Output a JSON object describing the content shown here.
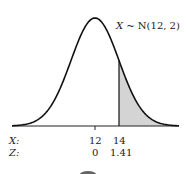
{
  "chart_data": {
    "type": "area",
    "title": "X ~ N(12, 2)",
    "distribution": {
      "name": "Normal",
      "mean": 12,
      "sd": 2
    },
    "shaded_region": {
      "from_x": 14,
      "to": "infinity",
      "from_z": 1.41,
      "color": "#d3d3d3"
    },
    "axis_rows": [
      {
        "label": "X:",
        "ticks": [
          "12",
          "14"
        ]
      },
      {
        "label": "Z:",
        "ticks": [
          "0",
          "1.41"
        ]
      }
    ],
    "grid": false,
    "legend": "none"
  },
  "labels": {
    "title_var": "X",
    "title_rest": " ~ N(12, 2)",
    "x_row": "X:",
    "z_row": "Z:",
    "x_mean": "12",
    "x_cut": "14",
    "z_mean": "0",
    "z_cut": "1.41"
  }
}
